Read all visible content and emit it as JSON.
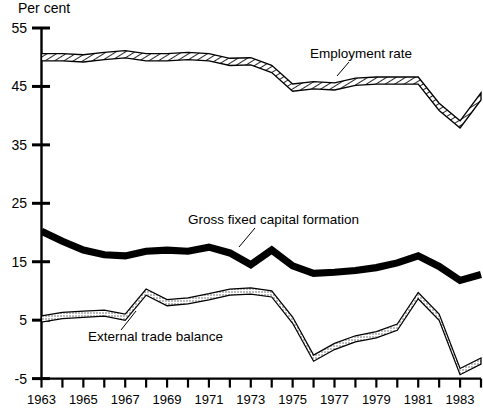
{
  "chart_data": {
    "type": "line",
    "title": "",
    "subtitle": "",
    "ylabel": "Per cent",
    "xlabel": "",
    "ylim": [
      -5,
      55
    ],
    "xlim": [
      1963,
      1984
    ],
    "grid": false,
    "legend_position": "inline-annotations",
    "ytick_labels": [
      "55",
      "45",
      "35",
      "25",
      "15",
      "5",
      "-5"
    ],
    "ytick_values": [
      55,
      45,
      35,
      25,
      15,
      5,
      -5
    ],
    "xtick_labels": [
      "1963",
      "1965",
      "1967",
      "1969",
      "1971",
      "1973",
      "1975",
      "1977",
      "1979",
      "1981",
      "1983"
    ],
    "xtick_values": [
      1963,
      1965,
      1967,
      1969,
      1971,
      1973,
      1975,
      1977,
      1979,
      1981,
      1983
    ],
    "x": [
      1963,
      1964,
      1965,
      1966,
      1967,
      1968,
      1969,
      1970,
      1971,
      1972,
      1973,
      1974,
      1975,
      1976,
      1977,
      1978,
      1979,
      1980,
      1981,
      1982,
      1983,
      1984
    ],
    "series": [
      {
        "name": "Employment rate",
        "style": "hatched-band",
        "values": [
          50.0,
          50.0,
          49.8,
          50.2,
          50.5,
          50.0,
          50.0,
          50.2,
          50.0,
          49.2,
          49.3,
          48.0,
          44.8,
          45.2,
          45.0,
          45.8,
          46.0,
          46.0,
          46.0,
          41.5,
          38.5,
          43.3
        ]
      },
      {
        "name": "Gross fixed capital formation",
        "style": "solid-thick-black",
        "values": [
          20.2,
          18.5,
          17.0,
          16.2,
          16.0,
          16.8,
          17.0,
          16.8,
          17.5,
          16.5,
          14.5,
          17.0,
          14.3,
          13.0,
          13.2,
          13.5,
          14.0,
          14.8,
          16.0,
          14.2,
          11.8,
          12.8
        ]
      },
      {
        "name": "External trade balance",
        "style": "stippled-band",
        "values": [
          5.2,
          5.8,
          6.0,
          6.2,
          5.5,
          9.8,
          8.0,
          8.3,
          9.0,
          9.8,
          10.0,
          9.5,
          5.0,
          -1.5,
          0.5,
          1.8,
          2.5,
          3.8,
          9.2,
          5.5,
          -3.8,
          -2.0
        ]
      }
    ],
    "annotations": [
      {
        "text": "Employment rate",
        "x": 310,
        "y": 58
      },
      {
        "text": "Gross fixed capital formation",
        "x": 188,
        "y": 224
      },
      {
        "text": "External trade balance",
        "x": 88,
        "y": 341
      }
    ],
    "colors": {
      "axis": "#000000",
      "employment_rate": "#000000",
      "gross_fixed_capital_formation": "#000000",
      "external_trade_balance": "#000000",
      "background": "#ffffff"
    }
  }
}
